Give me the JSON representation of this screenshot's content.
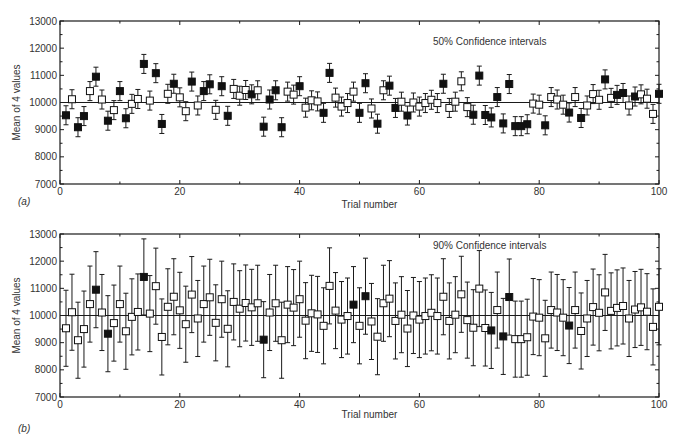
{
  "chart_data": [
    {
      "type": "scatter",
      "panel_label": "(a)",
      "title": "50% Confidence intervals",
      "xlabel": "Trial number",
      "ylabel": "Mean of 4 values",
      "xlim": [
        0,
        100
      ],
      "ylim": [
        7000,
        13000
      ],
      "xticks": [
        0,
        20,
        40,
        60,
        80,
        100
      ],
      "yticks": [
        7000,
        8000,
        9000,
        10000,
        11000,
        12000,
        13000
      ],
      "reference_line": 10000,
      "grid": false,
      "legend": "filled square = interval excludes 10000; open square = interval contains 10000",
      "half_width": 350,
      "x": [
        1,
        2,
        3,
        4,
        5,
        6,
        7,
        8,
        9,
        10,
        11,
        12,
        13,
        14,
        15,
        16,
        17,
        18,
        19,
        20,
        21,
        22,
        23,
        24,
        25,
        26,
        27,
        28,
        29,
        30,
        31,
        32,
        33,
        34,
        35,
        36,
        37,
        38,
        39,
        40,
        41,
        42,
        43,
        44,
        45,
        46,
        47,
        48,
        49,
        50,
        51,
        52,
        53,
        54,
        55,
        56,
        57,
        58,
        59,
        60,
        61,
        62,
        63,
        64,
        65,
        66,
        67,
        68,
        69,
        70,
        71,
        72,
        73,
        74,
        75,
        76,
        77,
        78,
        79,
        80,
        81,
        82,
        83,
        84,
        85,
        86,
        87,
        88,
        89,
        90,
        91,
        92,
        93,
        94,
        95,
        96,
        97,
        98,
        99,
        100
      ],
      "values": [
        9530,
        10120,
        9090,
        9500,
        10420,
        10950,
        10110,
        9330,
        9720,
        10420,
        9420,
        9950,
        10130,
        11420,
        10070,
        11080,
        9210,
        10320,
        10690,
        10190,
        9680,
        10770,
        9890,
        10420,
        10670,
        9730,
        10600,
        9510,
        10500,
        10250,
        10460,
        10300,
        10450,
        9110,
        10110,
        10450,
        9090,
        10400,
        10290,
        10600,
        9810,
        10080,
        10040,
        9620,
        11090,
        10180,
        9850,
        9980,
        10400,
        9620,
        10710,
        9780,
        9220,
        10450,
        10620,
        9800,
        10030,
        9520,
        10000,
        9850,
        9980,
        10100,
        9980,
        10690,
        9800,
        10030,
        10780,
        9830,
        9550,
        10990,
        9540,
        9450,
        10200,
        9230,
        10680,
        9130,
        9130,
        9200,
        9960,
        9920,
        9160,
        10200,
        10110,
        9920,
        9630,
        10200,
        9430,
        9890,
        10310,
        10100,
        10850,
        10170,
        10280,
        10350,
        9890,
        10220,
        10300,
        10140,
        9580,
        10320
      ],
      "filled": [
        1,
        0,
        1,
        1,
        0,
        1,
        0,
        1,
        0,
        1,
        1,
        0,
        0,
        1,
        0,
        1,
        1,
        0,
        1,
        0,
        0,
        1,
        0,
        1,
        1,
        0,
        1,
        1,
        0,
        0,
        0,
        1,
        0,
        1,
        1,
        1,
        1,
        0,
        0,
        1,
        0,
        0,
        0,
        1,
        1,
        0,
        0,
        0,
        0,
        1,
        1,
        0,
        1,
        0,
        1,
        1,
        0,
        1,
        0,
        0,
        0,
        0,
        0,
        1,
        0,
        0,
        0,
        0,
        1,
        1,
        1,
        1,
        1,
        1,
        1,
        1,
        1,
        1,
        0,
        0,
        1,
        0,
        0,
        0,
        1,
        0,
        1,
        0,
        0,
        0,
        1,
        0,
        1,
        1,
        0,
        1,
        0,
        0,
        0,
        1
      ]
    },
    {
      "type": "scatter",
      "panel_label": "(b)",
      "title": "90% Confidence intervals",
      "xlabel": "Trial number",
      "ylabel": "Mean of 4 values",
      "xlim": [
        0,
        100
      ],
      "ylim": [
        7000,
        13000
      ],
      "xticks": [
        0,
        20,
        40,
        60,
        80,
        100
      ],
      "yticks": [
        7000,
        8000,
        9000,
        10000,
        11000,
        12000,
        13000
      ],
      "reference_line": 10000,
      "grid": false,
      "legend": "filled square = interval excludes 10000; open square = interval contains 10000",
      "half_width": 1400,
      "x": [
        1,
        2,
        3,
        4,
        5,
        6,
        7,
        8,
        9,
        10,
        11,
        12,
        13,
        14,
        15,
        16,
        17,
        18,
        19,
        20,
        21,
        22,
        23,
        24,
        25,
        26,
        27,
        28,
        29,
        30,
        31,
        32,
        33,
        34,
        35,
        36,
        37,
        38,
        39,
        40,
        41,
        42,
        43,
        44,
        45,
        46,
        47,
        48,
        49,
        50,
        51,
        52,
        53,
        54,
        55,
        56,
        57,
        58,
        59,
        60,
        61,
        62,
        63,
        64,
        65,
        66,
        67,
        68,
        69,
        70,
        71,
        72,
        73,
        74,
        75,
        76,
        77,
        78,
        79,
        80,
        81,
        82,
        83,
        84,
        85,
        86,
        87,
        88,
        89,
        90,
        91,
        92,
        93,
        94,
        95,
        96,
        97,
        98,
        99,
        100
      ],
      "values": [
        9530,
        10120,
        9090,
        9500,
        10420,
        10950,
        10110,
        9330,
        9720,
        10420,
        9420,
        9950,
        10130,
        11420,
        10070,
        11080,
        9210,
        10320,
        10690,
        10190,
        9680,
        10770,
        9890,
        10420,
        10670,
        9730,
        10600,
        9510,
        10500,
        10250,
        10460,
        10300,
        10450,
        9110,
        10110,
        10450,
        9090,
        10400,
        10290,
        10600,
        9810,
        10080,
        10040,
        9620,
        11090,
        10180,
        9850,
        9980,
        10400,
        9620,
        10710,
        9780,
        9220,
        10450,
        10620,
        9800,
        10030,
        9520,
        10000,
        9850,
        9980,
        10100,
        9980,
        10690,
        9800,
        10030,
        10780,
        9830,
        9550,
        10990,
        9540,
        9450,
        10200,
        9230,
        10680,
        9130,
        9130,
        9200,
        9960,
        9920,
        9160,
        10200,
        10110,
        9920,
        9630,
        10200,
        9430,
        9890,
        10310,
        10100,
        10850,
        10170,
        10280,
        10350,
        9890,
        10220,
        10300,
        10140,
        9580,
        10320
      ],
      "filled": [
        0,
        0,
        0,
        0,
        0,
        1,
        0,
        1,
        0,
        0,
        0,
        0,
        0,
        1,
        0,
        0,
        0,
        0,
        0,
        0,
        0,
        0,
        0,
        0,
        0,
        0,
        0,
        0,
        0,
        0,
        0,
        0,
        0,
        1,
        0,
        0,
        0,
        0,
        0,
        0,
        0,
        0,
        0,
        0,
        0,
        0,
        0,
        0,
        1,
        0,
        1,
        0,
        0,
        0,
        0,
        0,
        0,
        0,
        0,
        0,
        0,
        0,
        0,
        0,
        0,
        0,
        0,
        0,
        0,
        0,
        0,
        1,
        0,
        1,
        1,
        0,
        0,
        0,
        0,
        0,
        0,
        0,
        0,
        0,
        1,
        0,
        0,
        0,
        0,
        0,
        0,
        0,
        0,
        0,
        0,
        0,
        0,
        0,
        0,
        0
      ]
    }
  ]
}
